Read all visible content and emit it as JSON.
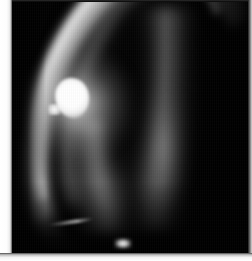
{
  "image": {
    "title": "Grayscale luminescence image",
    "kind": "scientific-grayscale-photograph",
    "width_px": 252,
    "height_px": 261,
    "background_color": "#000000",
    "border": {
      "left_margin_color": "#ffffff",
      "bottom_margin_color": "#ffffff",
      "right_edge_color": "#d8d8d8"
    },
    "plate": {
      "left_px": 12,
      "top_px": 0,
      "width_px": 238,
      "height_px": 254,
      "fill_color": "#020202"
    },
    "features": [
      {
        "name": "outer-luminous-arc",
        "description": "Bright curved band sweeping from upper middle down to lower left, crescent shaped",
        "peak_gray": "#e4e4e4",
        "center_x_px": 95,
        "center_y_px": 110
      },
      {
        "name": "inner-luminous-arc",
        "description": "Dimmer secondary band parallel to and inside the outer arc",
        "peak_gray": "#767676",
        "center_x_px": 120,
        "center_y_px": 105
      },
      {
        "name": "right-vertical-band",
        "description": "Dim vertical band on the right converging downward with the left band",
        "peak_gray": "#808080",
        "center_x_px": 152,
        "center_y_px": 150
      },
      {
        "name": "central-dark-gap",
        "description": "Black wedge separating the two luminous bands",
        "peak_gray": "#000000",
        "center_x_px": 127,
        "center_y_px": 90
      },
      {
        "name": "primary-hotspot",
        "description": "Saturated white blob on the left flank of the outer arc",
        "peak_gray": "#ffffff",
        "center_x_px": 72,
        "center_y_px": 98
      },
      {
        "name": "bottom-speck",
        "description": "Small isolated bright speck near the bottom centre",
        "peak_gray": "#ffffff",
        "center_x_px": 123,
        "center_y_px": 244
      },
      {
        "name": "diagonal-streak",
        "description": "Faint thin diagonal streak in the lower left quadrant",
        "peak_gray": "#cdcdcd",
        "center_x_px": 60,
        "center_y_px": 224
      }
    ]
  }
}
